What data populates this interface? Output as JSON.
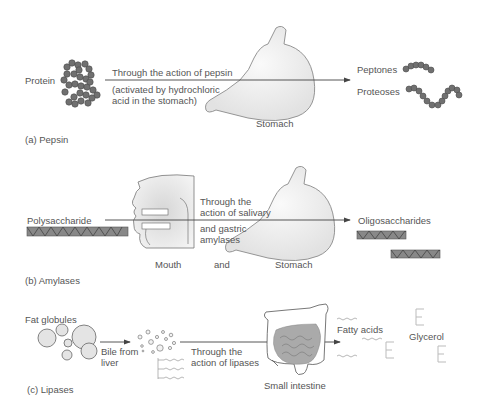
{
  "panels": [
    {
      "id": "a",
      "caption": "(a) Pepsin",
      "substrate": "Protein",
      "action_line1": "Through the action of pepsin",
      "action_line2": "(activated by hydrochloric",
      "action_line3": "acid in the stomach)",
      "organ": "Stomach",
      "products": [
        "Peptones",
        "Proteoses"
      ]
    },
    {
      "id": "b",
      "caption": "(b) Amylases",
      "substrate": "Polysaccharide",
      "action_line1": "Through the",
      "action_line2": "action of salivary",
      "action_line3": "and gastric",
      "action_line4": "amylases",
      "organ_1": "Mouth",
      "connector": "and",
      "organ_2": "Stomach",
      "products": [
        "Oligosaccharides"
      ]
    },
    {
      "id": "c",
      "caption": "(c) Lipases",
      "substrate": "Fat globules",
      "step1_line1": "Bile from",
      "step1_line2": "liver",
      "action_line1": "Through the",
      "action_line2": "action of lipases",
      "organ": "Small intestine",
      "products": [
        "Fatty acids",
        "Glycerol"
      ]
    }
  ],
  "colors": {
    "bead": "#707070",
    "bead_stroke": "#4a4a4a",
    "organ_fill": "#ececec",
    "organ_stroke": "#8a8a8a",
    "text": "#555555",
    "arrow": "#444444"
  }
}
